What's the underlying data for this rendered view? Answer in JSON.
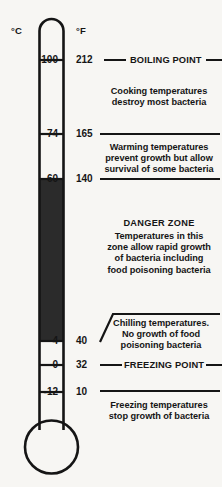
{
  "scales": {
    "celsius_header": "°C",
    "fahrenheit_header": "°F"
  },
  "ticks": [
    {
      "celsius": "100",
      "fahrenheit": "212"
    },
    {
      "celsius": "74",
      "fahrenheit": "165"
    },
    {
      "celsius": "60",
      "fahrenheit": "140"
    },
    {
      "celsius": "4",
      "fahrenheit": "40"
    },
    {
      "celsius": "0",
      "fahrenheit": "32"
    },
    {
      "celsius": "-12",
      "fahrenheit": "10"
    }
  ],
  "markers": {
    "boiling_point": "BOILING POINT",
    "freezing_point": "FREEZING POINT"
  },
  "zones": {
    "cooking": "Cooking temperatures\ndestroy most bacteria",
    "warming": "Warming temperatures\nprevent growth but allow\nsurvival of some bacteria",
    "danger_title": "DANGER ZONE",
    "danger_body": "Temperatures in this\nzone allow rapid growth\nof bacteria including\nfood poisoning bacteria",
    "chilling": "Chilling temperatures.\nNo growth of food\npoisoning bacteria",
    "freezing": "Freezing temperatures\nstop growth of bacteria"
  },
  "chart_data": {
    "type": "table",
    "xlabel": "",
    "ylabel": "Temperature",
    "grid": false,
    "legend_position": "none",
    "axes": [
      {
        "name": "Celsius",
        "unit": "°C",
        "ticks": [
          100,
          74,
          60,
          4,
          0,
          -12
        ]
      },
      {
        "name": "Fahrenheit",
        "unit": "°F",
        "ticks": [
          212,
          165,
          140,
          40,
          32,
          10
        ]
      }
    ],
    "mercury_fill": {
      "from_c": 4,
      "to_c": 60,
      "from_f": 40,
      "to_f": 140,
      "color": "#2b2b2b"
    },
    "bands": [
      {
        "label": "Cooking temperatures destroy most bacteria",
        "upper_c": 100,
        "lower_c": 74,
        "upper_f": 212,
        "lower_f": 165
      },
      {
        "label": "Warming temperatures prevent growth but allow survival of some bacteria",
        "upper_c": 74,
        "lower_c": 60,
        "upper_f": 165,
        "lower_f": 140
      },
      {
        "label": "DANGER ZONE — Temperatures in this zone allow rapid growth of bacteria including food poisoning bacteria",
        "upper_c": 60,
        "lower_c": 4,
        "upper_f": 140,
        "lower_f": 40
      },
      {
        "label": "Chilling temperatures. No growth of food poisoning bacteria",
        "upper_c": 4,
        "lower_c": 0,
        "upper_f": 40,
        "lower_f": 32
      },
      {
        "label": "Freezing temperatures stop growth of bacteria",
        "upper_c": 0,
        "lower_c": -12,
        "upper_f": 32,
        "lower_f": 10
      }
    ],
    "annotations": [
      {
        "text": "BOILING POINT",
        "at_c": 100,
        "at_f": 212
      },
      {
        "text": "FREEZING POINT",
        "at_c": 0,
        "at_f": 32
      }
    ]
  }
}
